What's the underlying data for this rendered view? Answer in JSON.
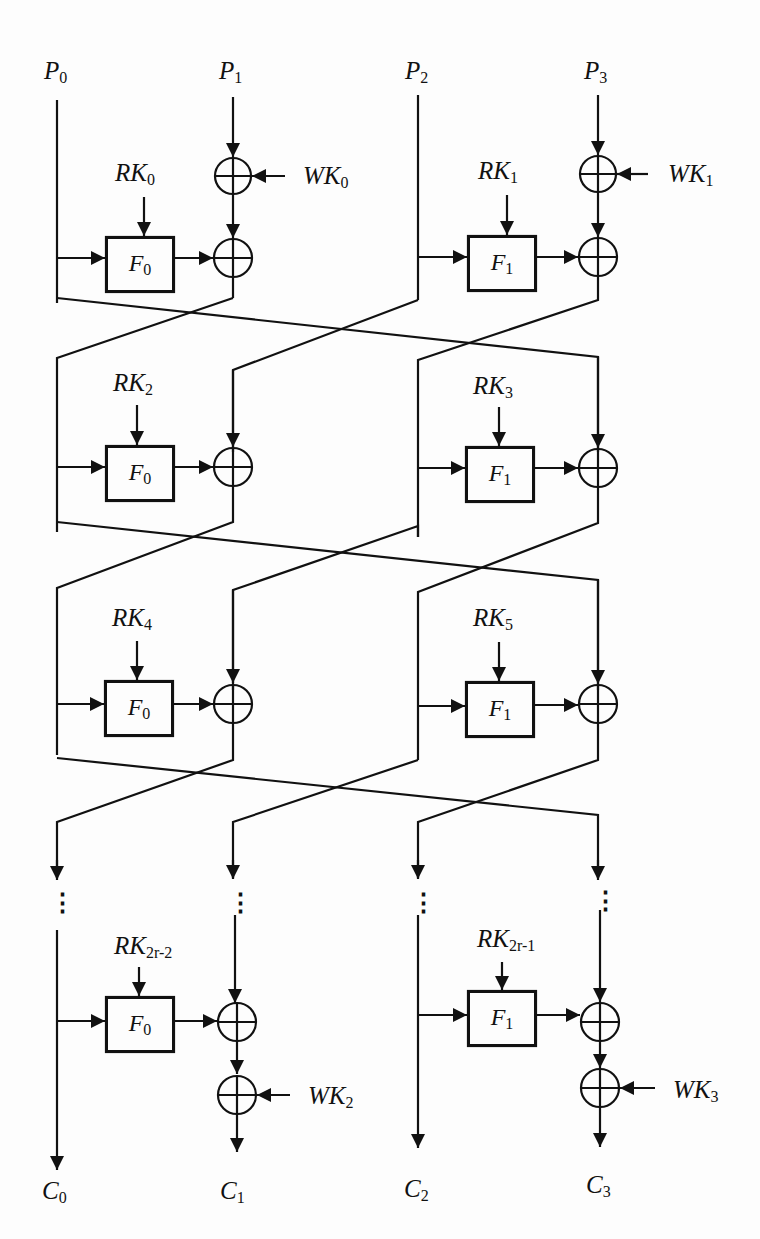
{
  "diagram": {
    "type": "block cipher round structure (4-branch generalized Feistel network)",
    "inputs": [
      {
        "name": "P",
        "sub": "0"
      },
      {
        "name": "P",
        "sub": "1"
      },
      {
        "name": "P",
        "sub": "2"
      },
      {
        "name": "P",
        "sub": "3"
      }
    ],
    "outputs": [
      {
        "name": "C",
        "sub": "0"
      },
      {
        "name": "C",
        "sub": "1"
      },
      {
        "name": "C",
        "sub": "2"
      },
      {
        "name": "C",
        "sub": "3"
      }
    ],
    "whitening_keys": [
      {
        "name": "WK",
        "sub": "0"
      },
      {
        "name": "WK",
        "sub": "1"
      },
      {
        "name": "WK",
        "sub": "2"
      },
      {
        "name": "WK",
        "sub": "3"
      }
    ],
    "round_keys": [
      {
        "name": "RK",
        "sub": "0"
      },
      {
        "name": "RK",
        "sub": "1"
      },
      {
        "name": "RK",
        "sub": "2"
      },
      {
        "name": "RK",
        "sub": "3"
      },
      {
        "name": "RK",
        "sub": "4"
      },
      {
        "name": "RK",
        "sub": "5"
      },
      {
        "name": "RK",
        "sub": "2r-2"
      },
      {
        "name": "RK",
        "sub": "2r-1"
      }
    ],
    "functions": [
      {
        "name": "F",
        "sub": "0"
      },
      {
        "name": "F",
        "sub": "1"
      }
    ],
    "ellipsis": "⋮"
  }
}
